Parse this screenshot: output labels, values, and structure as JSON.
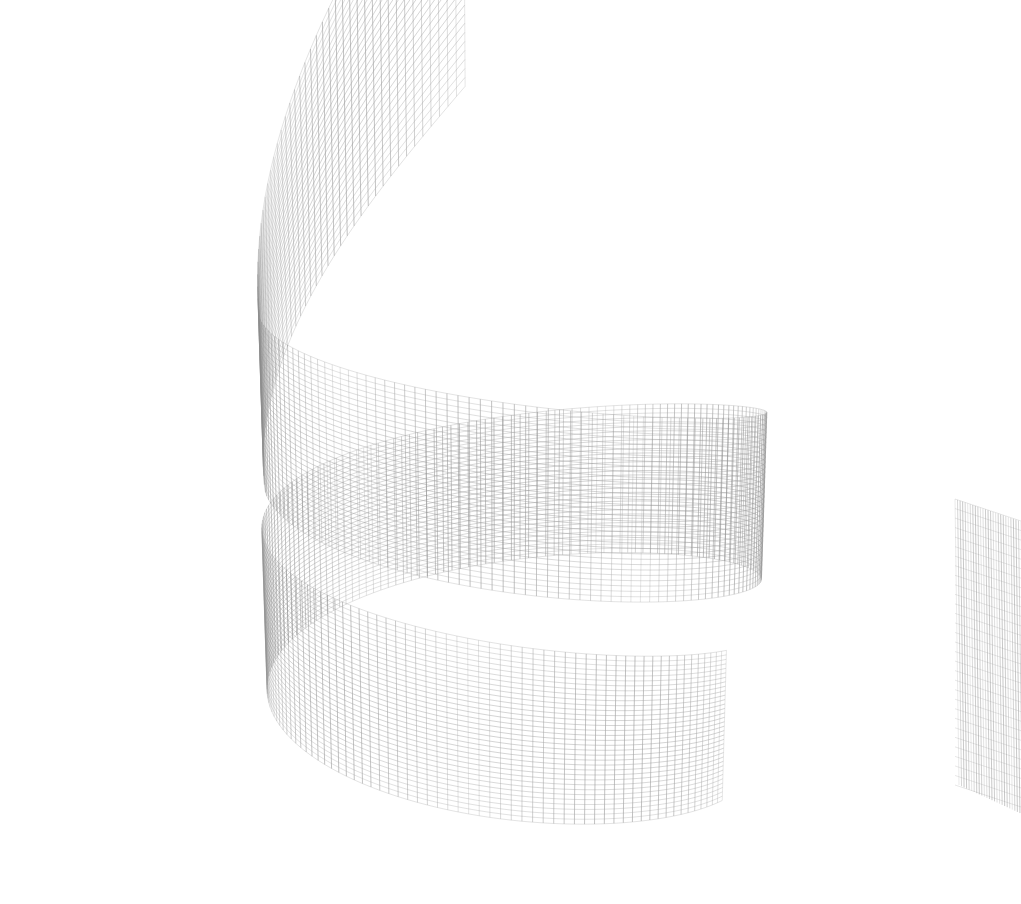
{
  "figure": {
    "title": "",
    "subtitle": "",
    "background_color": "#ffffff",
    "width": 1021,
    "height": 904,
    "has_axes": false,
    "has_axis_labels": false,
    "has_tick_labels": false,
    "has_legend": false,
    "has_colorbar": false,
    "has_title_text": false,
    "annotation_text": ""
  },
  "chart_data": {
    "type": "line",
    "render_style": "3d-wireframe-mesh",
    "title": "",
    "subtitle": "",
    "xlabel": "",
    "ylabel": "",
    "zlabel": "",
    "legend_position": "none",
    "grid": false,
    "axes_visible": false,
    "tick_labels_x": [],
    "tick_labels_y": [],
    "tick_labels_z": [],
    "surface_kind": "spiral-ribbon",
    "line_color": "#8c8c8c",
    "line_color_dark": "#4a4a4a",
    "line_width": 0.55,
    "background": "#ffffff",
    "mesh": {
      "u_divisions": 260,
      "v_divisions": 34,
      "u_label": "arc parameter (revolutions)",
      "v_label": "band width parameter",
      "u_range": [
        0.0,
        1.62
      ],
      "v_range": [
        0.0,
        1.0
      ]
    },
    "projection": {
      "type": "perspective",
      "elevation_deg": 14,
      "azimuth_deg": -62,
      "roll_deg": 0,
      "focal_length": 1150,
      "center_x": 512,
      "center_y": 520
    },
    "geometry": {
      "radius_outer": 1.0,
      "radius_inner": 0.985,
      "band_height": 0.66,
      "turns": 1.62,
      "pitch_per_turn": 0.92,
      "theta_start_deg": -196,
      "theta_end_deg": 388,
      "crease_at_theta_deg": -104
    },
    "series": [
      {
        "name": "u-isolines (vertical ribs)",
        "count": 260,
        "orientation": "across-band",
        "color": "#8a8a8a",
        "width": 0.6
      },
      {
        "name": "v-isolines (horizontal rings)",
        "count": 34,
        "orientation": "along-band",
        "color": "#9a9a9a",
        "width": 0.5
      }
    ],
    "segments": [
      {
        "name": "upper-panel",
        "screen_bbox": [
          150,
          28,
          300,
          390
        ],
        "note": "tall steeply-tilted panel, narrows from upper-left down to the crease"
      },
      {
        "name": "crease-fold",
        "screen_bbox": [
          230,
          330,
          70,
          90
        ],
        "note": "sharp V-shaped fold where the ribbon reverses direction"
      },
      {
        "name": "mid-left-band",
        "screen_bbox": [
          40,
          370,
          290,
          300
        ],
        "note": "band sweeping down-left toward the inner curve"
      },
      {
        "name": "lower-main-band",
        "screen_bbox": [
          35,
          610,
          950,
          290
        ],
        "note": "wide C-shaped band curving across the bottom of the frame"
      },
      {
        "name": "right-detached-panel",
        "screen_bbox": [
          955,
          495,
          66,
          300
        ],
        "note": "narrow near-vertical panel at the far right edge"
      }
    ],
    "x": [],
    "values": []
  }
}
